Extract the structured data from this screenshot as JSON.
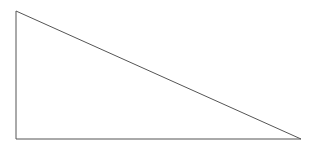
{
  "diagram": {
    "type": "right-triangle",
    "vertices": {
      "top_left": [
        16,
        11
      ],
      "bottom_left": [
        16,
        139
      ],
      "bottom_right": [
        301,
        139
      ]
    },
    "stroke_color": "#555555",
    "background_color": "#ffffff",
    "stroke_width": 1
  }
}
